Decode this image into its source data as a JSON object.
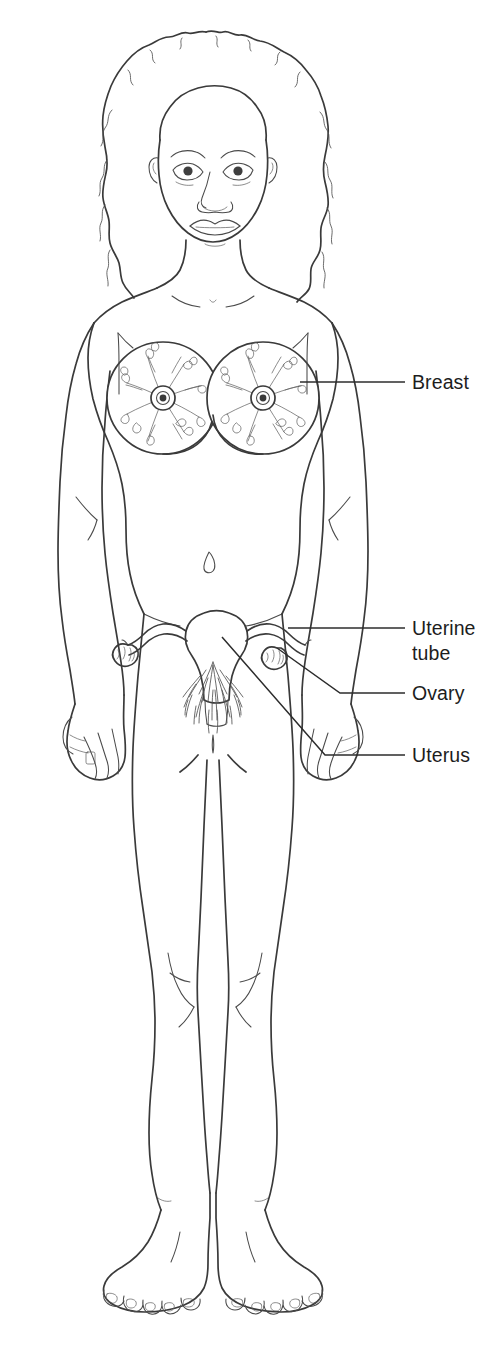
{
  "figure": {
    "view": "anterior",
    "style": "line-drawing",
    "background_color": "#ffffff",
    "line_color": "#3a3a3a",
    "text_color": "#1d1d1d",
    "width": 498,
    "height": 1370
  },
  "labels": [
    {
      "id": "breast",
      "text": "Breast",
      "lines": [
        "Breast"
      ],
      "text_x": 412,
      "text_y": 389,
      "leader": {
        "type": "straight",
        "points": "300,382 405,382"
      }
    },
    {
      "id": "uterine-tube",
      "text": "Uterine tube",
      "lines": [
        "Uterine",
        "tube"
      ],
      "text_x": 412,
      "text_y": 635,
      "leader": {
        "type": "straight",
        "points": "288,628 405,628"
      }
    },
    {
      "id": "ovary",
      "text": "Ovary",
      "lines": [
        "Ovary"
      ],
      "text_x": 412,
      "text_y": 700,
      "leader": {
        "type": "bent",
        "points": "277,648 340,693 405,693"
      }
    },
    {
      "id": "uterus",
      "text": "Uterus",
      "lines": [
        "Uterus"
      ],
      "text_x": 412,
      "text_y": 762,
      "leader": {
        "type": "bent",
        "points": "222,637 325,755 405,755"
      }
    }
  ],
  "anatomy_parts": [
    {
      "name": "head",
      "label": "Head"
    },
    {
      "name": "hair",
      "label": "Hair"
    },
    {
      "name": "face",
      "label": "Face"
    },
    {
      "name": "neck",
      "label": "Neck"
    },
    {
      "name": "shoulders",
      "label": "Shoulders"
    },
    {
      "name": "left-breast",
      "label": "Left breast"
    },
    {
      "name": "right-breast",
      "label": "Right breast"
    },
    {
      "name": "mammary-gland",
      "label": "Mammary gland"
    },
    {
      "name": "nipple",
      "label": "Nipple"
    },
    {
      "name": "navel",
      "label": "Navel"
    },
    {
      "name": "arms",
      "label": "Arms"
    },
    {
      "name": "hands",
      "label": "Hands"
    },
    {
      "name": "uterus",
      "label": "Uterus"
    },
    {
      "name": "uterine-tube",
      "label": "Uterine tube"
    },
    {
      "name": "ovary",
      "label": "Ovary"
    },
    {
      "name": "pubic-hair",
      "label": "Pubic hair"
    },
    {
      "name": "legs",
      "label": "Legs"
    },
    {
      "name": "knees",
      "label": "Knees"
    },
    {
      "name": "feet",
      "label": "Feet"
    }
  ]
}
